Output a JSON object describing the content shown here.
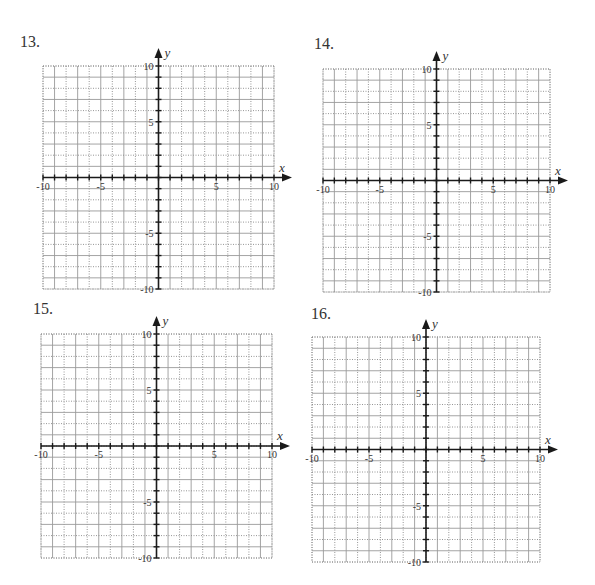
{
  "page": {
    "problems": [
      {
        "number": "13.",
        "label_pos": [
          20,
          33
        ],
        "grid": {
          "left": 43,
          "top": 66,
          "width": 231,
          "height": 223
        },
        "x_axis_label": "x",
        "y_axis_label": "y"
      },
      {
        "number": "14.",
        "label_pos": [
          314,
          35
        ],
        "grid": {
          "left": 323,
          "top": 69,
          "width": 227,
          "height": 223
        },
        "x_axis_label": "x",
        "y_axis_label": "y"
      },
      {
        "number": "15.",
        "label_pos": [
          33,
          300
        ],
        "grid": {
          "left": 41,
          "top": 334,
          "width": 231,
          "height": 224
        },
        "x_axis_label": "x",
        "y_axis_label": "y"
      },
      {
        "number": "16.",
        "label_pos": [
          311,
          305
        ],
        "grid": {
          "left": 312,
          "top": 337,
          "width": 228,
          "height": 225
        },
        "x_axis_label": "x",
        "y_axis_label": "y"
      }
    ],
    "axis": {
      "min": -10,
      "max": 10,
      "x_tick_labels": [
        "-10",
        "-5",
        "5",
        "10"
      ],
      "y_tick_labels": [
        "10",
        "5",
        "-5",
        "-10"
      ]
    },
    "colors": {
      "axis": "#1a1a1a",
      "grid_solid": "#9a9a9a",
      "grid_dotted": "#8a8a8a",
      "text": "#333333"
    }
  },
  "chart_data": [
    {
      "type": "scatter",
      "title": "13.",
      "xlabel": "x",
      "ylabel": "y",
      "xlim": [
        -10,
        10
      ],
      "ylim": [
        -10,
        10
      ],
      "grid": true,
      "x_ticks": [
        -10,
        -5,
        5,
        10
      ],
      "y_ticks": [
        10,
        5,
        -5,
        -10
      ],
      "series": []
    },
    {
      "type": "scatter",
      "title": "14.",
      "xlabel": "x",
      "ylabel": "y",
      "xlim": [
        -10,
        10
      ],
      "ylim": [
        -10,
        10
      ],
      "grid": true,
      "x_ticks": [
        -10,
        -5,
        5,
        10
      ],
      "y_ticks": [
        10,
        5,
        -5,
        -10
      ],
      "series": []
    },
    {
      "type": "scatter",
      "title": "15.",
      "xlabel": "x",
      "ylabel": "y",
      "xlim": [
        -10,
        10
      ],
      "ylim": [
        -10,
        10
      ],
      "grid": true,
      "x_ticks": [
        -10,
        -5,
        5,
        10
      ],
      "y_ticks": [
        10,
        5,
        -5,
        -10
      ],
      "series": []
    },
    {
      "type": "scatter",
      "title": "16.",
      "xlabel": "x",
      "ylabel": "y",
      "xlim": [
        -10,
        10
      ],
      "ylim": [
        -10,
        10
      ],
      "grid": true,
      "x_ticks": [
        -10,
        -5,
        5,
        10
      ],
      "y_ticks": [
        10,
        5,
        -5,
        -10
      ],
      "series": []
    }
  ]
}
